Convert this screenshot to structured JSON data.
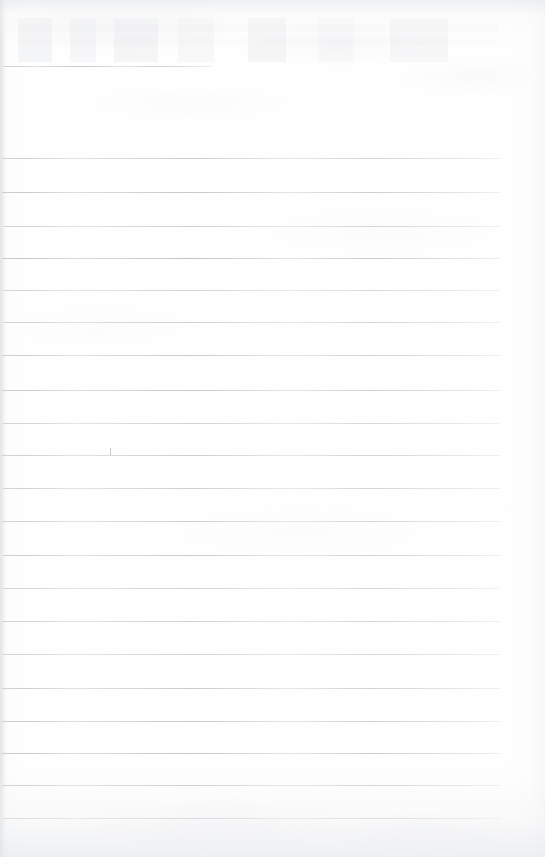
{
  "document": {
    "kind": "scanned-blank-lined-notebook-page",
    "page_width": 545,
    "page_height": 857,
    "paper_color": "#fefefe",
    "rule_color": "#9aa0a8",
    "has_written_content": false,
    "has_visible_text": false,
    "alt_text": "A scanned blank ruled notebook page with faint horizontal ruling lines and no handwriting."
  },
  "ruling": {
    "line_count": 24,
    "spacing_px": 33,
    "default_left_px": 3,
    "default_right_px": 500,
    "lines": [
      {
        "id": "rule-01",
        "y": 66,
        "left": 3,
        "right": 212,
        "opacity": 0.5,
        "note": "short partial rule"
      },
      {
        "id": "rule-02",
        "y": 158,
        "left": 2,
        "right": 500,
        "opacity": 0.46
      },
      {
        "id": "rule-03",
        "y": 192,
        "left": 2,
        "right": 500,
        "opacity": 0.52
      },
      {
        "id": "rule-04",
        "y": 226,
        "left": 3,
        "right": 500,
        "opacity": 0.44
      },
      {
        "id": "rule-05",
        "y": 258,
        "left": 2,
        "right": 500,
        "opacity": 0.56
      },
      {
        "id": "rule-06",
        "y": 290,
        "left": 3,
        "right": 500,
        "opacity": 0.4
      },
      {
        "id": "rule-07",
        "y": 322,
        "left": 3,
        "right": 500,
        "opacity": 0.44
      },
      {
        "id": "rule-08",
        "y": 355,
        "left": 2,
        "right": 500,
        "opacity": 0.48
      },
      {
        "id": "rule-09",
        "y": 390,
        "left": 2,
        "right": 500,
        "opacity": 0.5,
        "note": "darker to x=348 then fades"
      },
      {
        "id": "rule-10",
        "y": 423,
        "left": 3,
        "right": 500,
        "opacity": 0.42
      },
      {
        "id": "rule-11",
        "y": 455,
        "left": 2,
        "right": 500,
        "opacity": 0.46
      },
      {
        "id": "rule-12",
        "y": 488,
        "left": 3,
        "right": 500,
        "opacity": 0.44
      },
      {
        "id": "rule-13",
        "y": 521,
        "left": 2,
        "right": 500,
        "opacity": 0.44
      },
      {
        "id": "rule-14",
        "y": 555,
        "left": 3,
        "right": 500,
        "opacity": 0.48
      },
      {
        "id": "rule-15",
        "y": 588,
        "left": 3,
        "right": 500,
        "opacity": 0.42
      },
      {
        "id": "rule-16",
        "y": 621,
        "left": 2,
        "right": 500,
        "opacity": 0.44
      },
      {
        "id": "rule-17",
        "y": 654,
        "left": 3,
        "right": 500,
        "opacity": 0.42
      },
      {
        "id": "rule-18",
        "y": 688,
        "left": 2,
        "right": 500,
        "opacity": 0.48
      },
      {
        "id": "rule-19",
        "y": 721,
        "left": 2,
        "right": 500,
        "opacity": 0.5
      },
      {
        "id": "rule-20",
        "y": 753,
        "left": 2,
        "right": 500,
        "opacity": 0.52
      },
      {
        "id": "rule-21",
        "y": 785,
        "left": 2,
        "right": 500,
        "opacity": 0.48
      },
      {
        "id": "rule-22",
        "y": 818,
        "left": 3,
        "right": 500,
        "opacity": 0.44
      }
    ]
  },
  "artifacts": {
    "stray_tick": {
      "x": 110,
      "y": 448,
      "height": 7
    },
    "bleed_through_region": {
      "x": 18,
      "y": 18,
      "width": 480,
      "height": 44
    }
  }
}
